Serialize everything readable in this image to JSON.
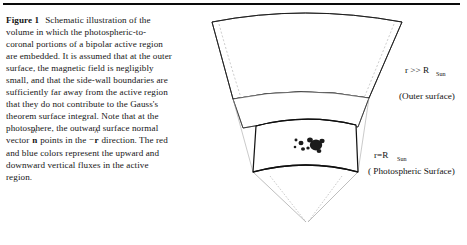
{
  "figure": {
    "label": "Figure 1",
    "caption_parts": {
      "p1": "Schematic illustration of the volume in which the photospheric-to-coronal portions of a bipolar active region are embedded. It is assumed that at the outer surface, the magnetic field is negligibly small, and that the side-wall boundaries are sufficiently far away from the active region that they do not contribute to the Gauss's theorem surface integral. Note that at the photosphere, the outward surface normal vector ",
      "vec_n": "n",
      "vec_n_hat": "^",
      "p2": " points in the −",
      "vec_r": "r",
      "vec_r_hat": "^",
      "p3": " direction. The red and blue colors represent the upward and downward vertical fluxes in the active region."
    },
    "full_caption": "Figure 1  Schematic illustration of the volume in which the photospheric-to-coronal portions of a bipolar active region are embedded. It is assumed that at the outer surface, the magnetic field is negligibly small, and that the side-wall boundaries are sufficiently far away from the active region that they do not contribute to the Gauss's theorem surface integral. Note that at the photosphere, the outward surface normal vector n̂ points in the −r̂ direction. The red and blue colors represent the upward and downward vertical fluxes in the active region."
  },
  "diagram": {
    "labels": {
      "outer_radius": {
        "main": "r >> R",
        "sub": "Sun"
      },
      "outer_surface": "(Outer surface)",
      "inner_radius": {
        "main": "r=R",
        "sub": "Sun"
      },
      "photospheric_surface": "( Photospheric Surface)"
    },
    "colors": {
      "stroke": "#1a1a1a",
      "hidden_stroke": "#9a9a9a",
      "ray_stroke": "#8a8a8a",
      "active_region_dark": "#171717",
      "background": "#ffffff"
    },
    "active_region": {
      "description": "bipolar active region spots",
      "spot_count": 9
    }
  }
}
